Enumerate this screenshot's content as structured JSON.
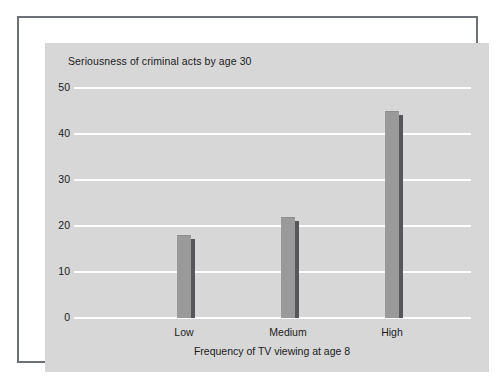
{
  "chart_data": {
    "type": "bar",
    "title": "Seriousness of criminal acts by age 30",
    "xlabel": "Frequency of TV viewing at age 8",
    "ylabel": "",
    "categories": [
      "Low",
      "Medium",
      "High"
    ],
    "values": [
      18,
      22,
      45
    ],
    "ylim": [
      0,
      50
    ],
    "yticks": [
      "0",
      "10",
      "20",
      "30",
      "40",
      "50"
    ],
    "ytick_values": [
      0,
      10,
      20,
      30,
      40,
      50
    ],
    "grid": true,
    "legend": "none",
    "colors": {
      "panel_background": "#d7d7d7",
      "gridline": "#fdfdfd",
      "bar_face": "#9a9a9a",
      "bar_side": "#55575b",
      "frame_border": "#6d7075",
      "text": "#1b1b1b",
      "page_background": "#ffffff"
    }
  }
}
